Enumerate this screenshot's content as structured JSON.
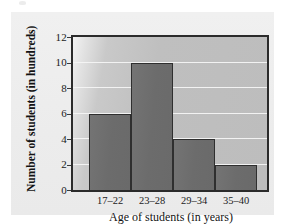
{
  "chart_data": {
    "type": "bar",
    "title": "",
    "subtitle": "",
    "xlabel": "Age of students (in years)",
    "ylabel": "Number of students (in hundreds)",
    "categories": [
      "17–22",
      "23–28",
      "29–34",
      "35–40"
    ],
    "values": [
      6,
      10,
      4,
      2
    ],
    "series": [
      {
        "name": "Number of students (in hundreds)",
        "values": [
          6,
          10,
          4,
          2
        ]
      }
    ],
    "ylim": [
      0,
      12
    ],
    "yticks": [
      0,
      2,
      4,
      6,
      8,
      10,
      12
    ],
    "ytick_labels": [
      "0",
      "2",
      "4",
      "6",
      "8",
      "10",
      "12"
    ],
    "xtick_labels": [
      "17–22",
      "23–28",
      "29–34",
      "35–40"
    ],
    "grid": "horizontal",
    "legend": "none",
    "legend_position": "none",
    "annotations": [],
    "colors": {
      "bar_fill": "#6f6f6f",
      "bar_edge": "#2f2f2f",
      "plot_background": "#c2c2c2",
      "gridline": "#f4f4f4",
      "axis": "#2b2b2b",
      "figure_background": "#eeeeee",
      "text": "#131313"
    }
  }
}
